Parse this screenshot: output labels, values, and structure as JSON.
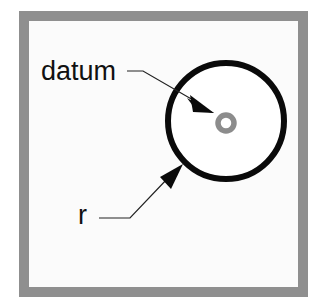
{
  "diagram": {
    "type": "annotated-geometry",
    "frame": {
      "border_color": "#8f8f8f",
      "fill_color": "#fbfbfb"
    },
    "circle": {
      "stroke_color": "#0a0a0a"
    },
    "datum_marker": {
      "color": "#8c8c8c"
    },
    "labels": {
      "datum": "datum",
      "radius": "r"
    }
  }
}
